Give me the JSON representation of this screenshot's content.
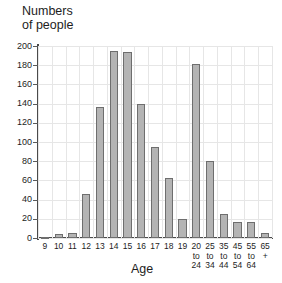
{
  "chart_data": {
    "type": "bar",
    "title": "",
    "subtitle": "",
    "ylabel": "Numbers\nof people",
    "xlabel": "Age",
    "ylim": [
      0,
      200
    ],
    "ytick_step": 20,
    "yticks": [
      0,
      20,
      40,
      60,
      80,
      100,
      120,
      140,
      160,
      180,
      200
    ],
    "grid": true,
    "legend": "none",
    "categories": [
      "9",
      "10",
      "11",
      "12",
      "13",
      "14",
      "15",
      "16",
      "17",
      "18",
      "19",
      "20\nto\n24",
      "25\nto\n34",
      "35\nto\n44",
      "45\nto\n54",
      "55\nto\n64",
      "65\n+"
    ],
    "values": [
      1,
      4,
      5,
      46,
      136,
      195,
      194,
      140,
      95,
      62,
      20,
      181,
      80,
      25,
      17,
      17,
      5
    ],
    "bar_fill_color": "#b4b4b4",
    "bar_border_color": "#6e6e6e",
    "axis_color": "#4a4a4a",
    "grid_color": "#e6e6e6",
    "background_color": "#ffffff"
  }
}
